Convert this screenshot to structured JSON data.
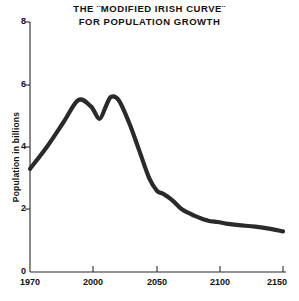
{
  "chart_data": {
    "type": "line",
    "title": "THE ¨MODIFIED IRISH CURVE¨",
    "title_line1": "THE ¨MODIFIED IRISH CURVE¨",
    "title_line2": "FOR POPULATION GROWTH",
    "subtitle": "FOR POPULATION GROWTH",
    "xlabel": "",
    "ylabel": "Population in billions",
    "xlim": [
      1970,
      2150
    ],
    "ylim": [
      0,
      8
    ],
    "grid": false,
    "legend": false,
    "x_ticks": [
      1970,
      2000,
      2050,
      2100,
      2150
    ],
    "x_tick_labels": [
      "1970",
      "2000",
      "2050",
      "2100",
      "2150"
    ],
    "y_ticks": [
      0,
      2,
      4,
      6,
      8
    ],
    "y_tick_labels": [
      "0",
      "2",
      "4",
      "6",
      "8"
    ],
    "series": [
      {
        "name": "Modified Irish curve",
        "color": "#2a2a2a",
        "x": [
          1970,
          1978,
          1986,
          1993,
          1999,
          2005,
          2010,
          2014,
          2020,
          2028,
          2036,
          2044,
          2050,
          2055,
          2062,
          2070,
          2080,
          2090,
          2098,
          2105,
          2115,
          2128,
          2140,
          2150
        ],
        "values": [
          3.3,
          4.0,
          4.8,
          5.5,
          5.3,
          4.9,
          5.3,
          5.6,
          5.5,
          4.8,
          3.9,
          3.0,
          2.6,
          2.5,
          2.3,
          2.0,
          1.8,
          1.65,
          1.6,
          1.55,
          1.5,
          1.45,
          1.38,
          1.3
        ]
      }
    ],
    "annotations": [
      {
        "label": "start",
        "x": 1970,
        "y": 3.3
      },
      {
        "label": "first peak",
        "x": 1993,
        "y": 5.5
      },
      {
        "label": "trough",
        "x": 2005,
        "y": 4.9
      },
      {
        "label": "second peak",
        "x": 2014,
        "y": 5.6
      },
      {
        "label": "shoulder",
        "x": 2055,
        "y": 2.5
      },
      {
        "label": "plateau",
        "x": 2100,
        "y": 1.55
      },
      {
        "label": "end",
        "x": 2150,
        "y": 1.3
      }
    ]
  },
  "colors": {
    "curve": "#2a2a2a",
    "axis": "#2b2b2b",
    "background": "#ffffff",
    "text": "#111111"
  }
}
